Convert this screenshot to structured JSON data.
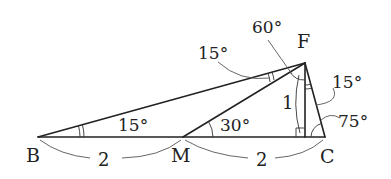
{
  "figure": {
    "points": {
      "B": {
        "label": "B",
        "x": 38,
        "y": 137
      },
      "M": {
        "label": "M",
        "x": 183,
        "y": 137
      },
      "C": {
        "label": "C",
        "x": 325,
        "y": 137
      },
      "F": {
        "label": "F",
        "x": 305,
        "y": 63
      },
      "H": {
        "label": "",
        "x": 305,
        "y": 137
      }
    },
    "segments": [
      "BC",
      "BF",
      "MF",
      "FC",
      "FH"
    ],
    "angles": {
      "FBC": "15°",
      "BFM": "15°",
      "FMC": "30°",
      "MFH": "60°",
      "HFC": "15°",
      "FCB": "75°",
      "FHC": "90°"
    },
    "lengths": {
      "BM": "2",
      "MC": "2",
      "FH": "1"
    }
  }
}
